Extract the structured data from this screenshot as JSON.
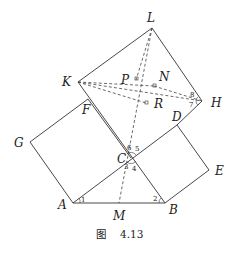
{
  "figure": {
    "caption_prefix": "图",
    "caption_number": "4.13"
  },
  "points": {
    "L": "L",
    "K": "K",
    "P": "P",
    "N": "N",
    "R": "R",
    "H": "H",
    "F": "F",
    "D": "D",
    "G": "G",
    "C": "C",
    "E": "E",
    "A": "A",
    "M": "M",
    "B": "B"
  },
  "angles": {
    "a1": "1",
    "a2": "2",
    "a3": "3",
    "a4": "4",
    "a5": "5",
    "a6": "6",
    "a7": "7",
    "a8": "8"
  },
  "colors": {
    "line": "#333333",
    "background": "#ffffff"
  }
}
